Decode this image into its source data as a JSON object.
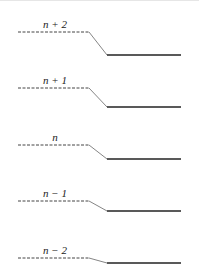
{
  "diagram": {
    "type": "energy-level-shift",
    "levels": [
      {
        "label": "n + 2",
        "dashed_y": 32,
        "solid_y": 55
      },
      {
        "label": "n + 1",
        "dashed_y": 88,
        "solid_y": 107
      },
      {
        "label": "n",
        "dashed_y": 145,
        "solid_y": 159
      },
      {
        "label": "n − 1",
        "dashed_y": 201,
        "solid_y": 211
      },
      {
        "label": "n − 2",
        "dashed_y": 258,
        "solid_y": 263
      }
    ],
    "geometry": {
      "dashed_x1": 18,
      "dashed_x2": 89,
      "solid_x1": 107,
      "solid_x2": 181,
      "label_x": 55
    },
    "colors": {
      "dashed": "#444444",
      "diagonal": "#666666",
      "solid": "#222222"
    }
  }
}
